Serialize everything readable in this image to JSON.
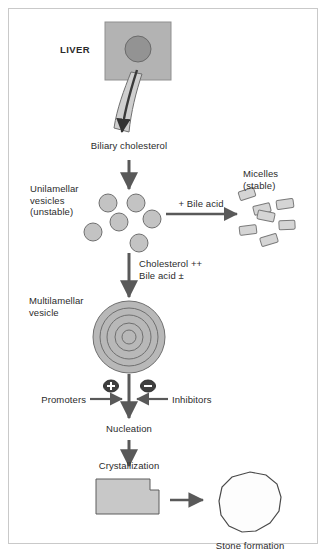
{
  "figure": {
    "width": 328,
    "height": 560,
    "background": "#ffffff",
    "border_color": "#c9c9c9",
    "text_color": "#2b2b2b",
    "shape_fill": "#b3b3b3",
    "shape_fill_light": "#cccccc",
    "shape_stroke": "#4d4d4d",
    "arrow_color": "#595959",
    "nucleus_fill": "#8c8c8c"
  },
  "labels": {
    "liver": "LIVER",
    "biliary_cholesterol": "Biliary cholesterol",
    "unilamellar_vesicles": "Unilamellar\nvesicles\n(unstable)",
    "bile_acid_arrow": "+ Bile acid",
    "micelles": "Micelles\n(stable)",
    "cholesterol_bile": "Cholesterol ++\nBile acid ±",
    "multilamellar_vesicle": "Multilamellar\nvesicle",
    "promoters": "Promoters",
    "inhibitors": "Inhibitors",
    "plus_sign": "+",
    "minus_sign": "–",
    "nucleation": "Nucleation",
    "crystallization": "Crystallization",
    "stone_formation": "Stone formation"
  },
  "shapes": {
    "liver_block": {
      "x": 105,
      "y": 22,
      "width": 66,
      "height": 58
    },
    "liver_nucleus": {
      "cx": 138,
      "cy": 49,
      "r": 13
    },
    "vesicles": [
      {
        "cx": 108,
        "cy": 203,
        "r": 9
      },
      {
        "cx": 136,
        "cy": 203,
        "r": 9
      },
      {
        "cx": 119,
        "cy": 222,
        "r": 9
      },
      {
        "cx": 152,
        "cy": 219,
        "r": 9
      },
      {
        "cx": 93,
        "cy": 232,
        "r": 9
      },
      {
        "cx": 139,
        "cy": 243,
        "r": 9
      }
    ],
    "micelles": [
      {
        "cx": 247,
        "cy": 194,
        "w": 16,
        "h": 9,
        "rot": -18
      },
      {
        "cx": 285,
        "cy": 204,
        "w": 17,
        "h": 9,
        "rot": -8
      },
      {
        "cx": 262,
        "cy": 209,
        "w": 17,
        "h": 9,
        "rot": -14
      },
      {
        "cx": 266,
        "cy": 216,
        "w": 17,
        "h": 9,
        "rot": 12
      },
      {
        "cx": 287,
        "cy": 225,
        "w": 16,
        "h": 9,
        "rot": -3
      },
      {
        "cx": 248,
        "cy": 230,
        "w": 17,
        "h": 9,
        "rot": -7
      },
      {
        "cx": 269,
        "cy": 240,
        "w": 17,
        "h": 9,
        "rot": -17
      }
    ],
    "multilamellar": {
      "cx": 129,
      "cy": 337,
      "radii": [
        36,
        29,
        22,
        14,
        7
      ]
    },
    "crystal_block": {
      "x": 96,
      "y": 479,
      "width": 63,
      "height": 35,
      "notch_w": 27,
      "notch_h": 11
    },
    "stone": {
      "cx": 250,
      "cy": 503,
      "r": 31
    }
  },
  "icons": {
    "plus_badge": "plus-circle-icon",
    "minus_badge": "minus-circle-icon",
    "down_arrow": "arrow-down-icon",
    "right_arrow": "arrow-right-icon",
    "left_arrow": "arrow-left-icon"
  }
}
